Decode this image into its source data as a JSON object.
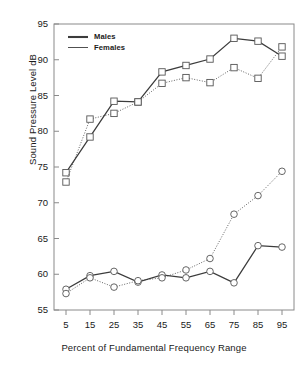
{
  "chart_data": {
    "type": "line",
    "title": "",
    "xlabel": "Percent of Fundamental Frequency Range",
    "ylabel": "Sound Pressure Level dB",
    "x": [
      5,
      15,
      25,
      35,
      45,
      55,
      65,
      75,
      85,
      95
    ],
    "xlim": [
      0,
      100
    ],
    "ylim": [
      55,
      95
    ],
    "xticks": [
      "5",
      "15",
      "25",
      "35",
      "45",
      "55",
      "65",
      "75",
      "85",
      "95"
    ],
    "yticks": [
      "55",
      "60",
      "65",
      "70",
      "75",
      "80",
      "85",
      "90",
      "95"
    ],
    "grid": false,
    "legend_position": "top-left",
    "legend": [
      {
        "name": "Males",
        "style": "thick-solid"
      },
      {
        "name": "Females",
        "style": "thin-solid"
      }
    ],
    "series": [
      {
        "name": "Males-maximum",
        "legend_group": "Males",
        "marker": "square",
        "line": "solid",
        "values": [
          74.2,
          79.2,
          84.2,
          84.1,
          88.3,
          89.2,
          90.1,
          93.0,
          92.6,
          90.5
        ]
      },
      {
        "name": "Females-maximum",
        "legend_group": "Females",
        "marker": "square",
        "line": "dotted",
        "values": [
          72.9,
          81.7,
          82.5,
          84.1,
          86.7,
          87.5,
          86.8,
          88.9,
          87.4,
          91.8
        ]
      },
      {
        "name": "Males-minimum",
        "legend_group": "Males",
        "marker": "circle",
        "line": "solid",
        "values": [
          57.9,
          59.8,
          60.4,
          58.9,
          59.9,
          59.5,
          60.4,
          58.8,
          64.0,
          63.8
        ]
      },
      {
        "name": "Females-minimum",
        "legend_group": "Females",
        "marker": "circle",
        "line": "dotted",
        "values": [
          57.3,
          59.5,
          58.2,
          59.1,
          59.5,
          60.6,
          62.2,
          68.4,
          71.0,
          74.4
        ]
      }
    ],
    "axis_color": "#8a8a8a",
    "line_color": "#3c3c3c",
    "marker_color": "#555555"
  }
}
